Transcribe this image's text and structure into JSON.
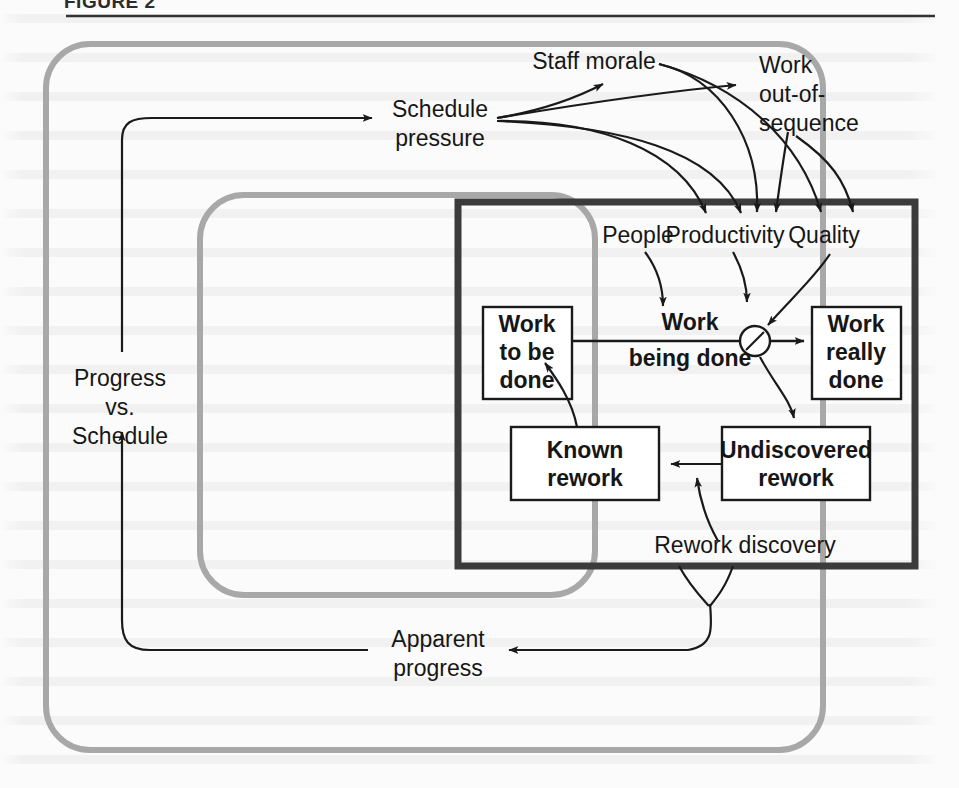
{
  "figure": {
    "caption": "FIGURE 2",
    "rule_color": "#333333"
  },
  "diagram": {
    "type": "system-dynamics-causal-loop",
    "colors": {
      "loop_gray": "#a8a8a8",
      "boundary_black": "#3b3b3b",
      "line_black": "#1a1a1a",
      "text": "#161616",
      "page_background": "#fbfbfb"
    },
    "outer_loop": {
      "label": "outer-feedback-loop",
      "x": 46,
      "y": 44,
      "width": 777,
      "height": 706,
      "radius": 44
    },
    "inner_loop": {
      "label": "inner-feedback-loop",
      "x": 200,
      "y": 195,
      "width": 395,
      "height": 400,
      "radius": 44
    },
    "project_boundary": {
      "label": "project-boundary-box",
      "x": 458,
      "y": 202,
      "width": 457,
      "height": 364
    },
    "stock_boxes": [
      {
        "id": "work-to-be-done",
        "lines": [
          "Work",
          "to be",
          "done"
        ],
        "x": 483,
        "y": 307,
        "width": 89,
        "height": 92
      },
      {
        "id": "work-really-done",
        "lines": [
          "Work",
          "really",
          "done"
        ],
        "x": 812,
        "y": 307,
        "width": 89,
        "height": 92
      },
      {
        "id": "known-rework",
        "lines": [
          "Known",
          "rework"
        ],
        "x": 511,
        "y": 427,
        "width": 148,
        "height": 73
      },
      {
        "id": "undiscovered-rework",
        "lines": [
          "Undiscovered",
          "rework"
        ],
        "x": 722,
        "y": 427,
        "width": 148,
        "height": 73
      }
    ],
    "flow_labels": [
      {
        "id": "work-being-done",
        "text_lines": [
          "Work",
          "being done"
        ],
        "x": 690,
        "y": 322
      }
    ],
    "valve": {
      "id": "quality-valve",
      "cx": 755,
      "cy": 341,
      "r": 15
    },
    "variables": [
      {
        "id": "schedule-pressure",
        "lines": [
          "Schedule",
          "pressure"
        ],
        "x": 440,
        "y": 117,
        "anchor": "middle"
      },
      {
        "id": "staff-morale",
        "lines": [
          "Staff morale"
        ],
        "x": 594,
        "y": 69,
        "anchor": "middle"
      },
      {
        "id": "work-out-of-sequence",
        "lines": [
          "Work",
          "out-of-",
          "sequence"
        ],
        "x": 759,
        "y": 73,
        "anchor": "start"
      },
      {
        "id": "people",
        "lines": [
          "People"
        ],
        "x": 638,
        "y": 243,
        "anchor": "middle"
      },
      {
        "id": "productivity",
        "lines": [
          "Productivity"
        ],
        "x": 725,
        "y": 243,
        "anchor": "middle"
      },
      {
        "id": "quality",
        "lines": [
          "Quality"
        ],
        "x": 824,
        "y": 243,
        "anchor": "middle"
      },
      {
        "id": "progress-vs-schedule",
        "lines": [
          "Progress",
          "vs.",
          "Schedule"
        ],
        "x": 120,
        "y": 394,
        "anchor": "middle"
      },
      {
        "id": "rework-discovery",
        "lines": [
          "Rework discovery"
        ],
        "x": 745,
        "y": 553,
        "anchor": "middle"
      },
      {
        "id": "apparent-progress",
        "lines": [
          "Apparent",
          "progress"
        ],
        "x": 438,
        "y": 653,
        "anchor": "middle"
      }
    ],
    "causal_links": [
      {
        "from": "schedule-pressure",
        "to": "staff-morale"
      },
      {
        "from": "schedule-pressure",
        "to": "work-out-of-sequence"
      },
      {
        "from": "schedule-pressure",
        "to": "productivity"
      },
      {
        "from": "schedule-pressure",
        "to": "quality"
      },
      {
        "from": "staff-morale",
        "to": "productivity"
      },
      {
        "from": "staff-morale",
        "to": "quality"
      },
      {
        "from": "work-out-of-sequence",
        "to": "productivity"
      },
      {
        "from": "work-out-of-sequence",
        "to": "quality"
      },
      {
        "from": "people",
        "to": "work-being-done"
      },
      {
        "from": "productivity",
        "to": "work-being-done"
      },
      {
        "from": "quality",
        "to": "quality-valve"
      },
      {
        "from": "work-to-be-done",
        "to": "work-really-done",
        "via": "work-being-done"
      },
      {
        "from": "quality-valve",
        "to": "undiscovered-rework"
      },
      {
        "from": "undiscovered-rework",
        "to": "known-rework"
      },
      {
        "from": "rework-discovery",
        "to": "undiscovered-rework-flow"
      },
      {
        "from": "known-rework",
        "to": "work-to-be-done"
      },
      {
        "from": "project-boundary",
        "to": "apparent-progress"
      },
      {
        "from": "apparent-progress",
        "to": "progress-vs-schedule"
      },
      {
        "from": "progress-vs-schedule",
        "to": "schedule-pressure"
      }
    ]
  }
}
